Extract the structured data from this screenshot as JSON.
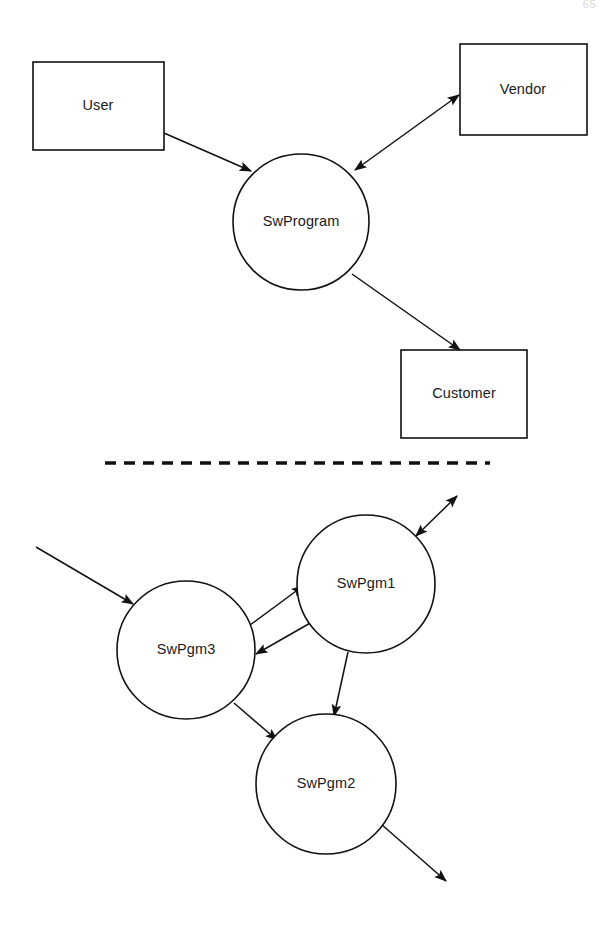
{
  "page": {
    "page_number": "65",
    "background_color": "#ffffff",
    "stroke_color": "#111111",
    "text_color": "#1a1a1a",
    "width": 615,
    "height": 933
  },
  "divider": {
    "name": "dashed-separator",
    "style": "dashed",
    "x1": 105,
    "y1": 463,
    "x2": 490,
    "y2": 463
  },
  "diagrams": [
    {
      "id": "top",
      "name": "context-diagram",
      "nodes": [
        {
          "id": "user",
          "label": "User",
          "shape": "rect",
          "x": 33,
          "y": 62,
          "w": 131,
          "h": 88,
          "cx": 98,
          "cy": 106
        },
        {
          "id": "vendor",
          "label": "Vendor",
          "shape": "rect",
          "x": 460,
          "y": 44,
          "w": 127,
          "h": 91,
          "cx": 523,
          "cy": 90
        },
        {
          "id": "customer",
          "label": "Customer",
          "shape": "rect",
          "x": 401,
          "y": 350,
          "w": 126,
          "h": 88,
          "cx": 464,
          "cy": 394
        },
        {
          "id": "swprogram",
          "label": "SwProgram",
          "shape": "circle",
          "cx": 301,
          "cy": 222,
          "r": 68
        }
      ],
      "edges": [
        {
          "id": "user-to-swprogram",
          "from": "user",
          "to": "swprogram",
          "arrow": "single",
          "x1": 164,
          "y1": 133,
          "x2": 251,
          "y2": 171
        },
        {
          "id": "swprogram-to-vendor",
          "from": "swprogram",
          "to": "vendor",
          "arrow": "double",
          "x1": 355,
          "y1": 170,
          "x2": 459,
          "y2": 95
        },
        {
          "id": "swprogram-to-customer",
          "from": "swprogram",
          "to": "customer",
          "arrow": "single",
          "x1": 352,
          "y1": 274,
          "x2": 460,
          "y2": 350
        }
      ]
    },
    {
      "id": "bottom",
      "name": "decomposition-diagram",
      "nodes": [
        {
          "id": "swpgm3",
          "label": "SwPgm3",
          "shape": "circle",
          "cx": 186,
          "cy": 650,
          "r": 69
        },
        {
          "id": "swpgm1",
          "label": "SwPgm1",
          "shape": "circle",
          "cx": 366,
          "cy": 584,
          "r": 69
        },
        {
          "id": "swpgm2",
          "label": "SwPgm2",
          "shape": "circle",
          "cx": 326,
          "cy": 784,
          "r": 70
        }
      ],
      "edges": [
        {
          "id": "external-in-to-swpgm3",
          "from": "external",
          "to": "swpgm3",
          "arrow": "single",
          "x1": 36,
          "y1": 547,
          "x2": 133,
          "y2": 604
        },
        {
          "id": "swpgm3-to-swpgm1",
          "from": "swpgm3",
          "to": "swpgm1",
          "arrow": "single",
          "x1": 250,
          "y1": 625,
          "x2": 303,
          "y2": 586
        },
        {
          "id": "swpgm1-to-swpgm3",
          "from": "swpgm1",
          "to": "swpgm3",
          "arrow": "single",
          "x1": 312,
          "y1": 622,
          "x2": 256,
          "y2": 654
        },
        {
          "id": "swpgm1-to-swpgm2",
          "from": "swpgm1",
          "to": "swpgm2",
          "arrow": "single",
          "x1": 348,
          "y1": 652,
          "x2": 334,
          "y2": 716
        },
        {
          "id": "swpgm3-to-swpgm2",
          "from": "swpgm3",
          "to": "swpgm2",
          "arrow": "single",
          "x1": 234,
          "y1": 703,
          "x2": 277,
          "y2": 740
        },
        {
          "id": "swpgm1-to-external",
          "from": "swpgm1",
          "to": "external",
          "arrow": "double",
          "x1": 416,
          "y1": 536,
          "x2": 457,
          "y2": 496
        },
        {
          "id": "swpgm2-to-external",
          "from": "swpgm2",
          "to": "external",
          "arrow": "single",
          "x1": 381,
          "y1": 824,
          "x2": 446,
          "y2": 881
        }
      ]
    }
  ]
}
